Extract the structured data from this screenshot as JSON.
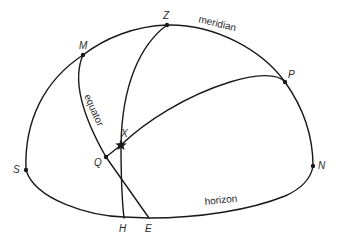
{
  "diagram": {
    "points": {
      "Z": {
        "label": "Z",
        "role": "zenith"
      },
      "M": {
        "label": "M",
        "role": "meridian–equator intersection"
      },
      "P": {
        "label": "P",
        "role": "celestial pole"
      },
      "X": {
        "label": "X",
        "role": "star"
      },
      "Q": {
        "label": "Q",
        "role": "equator point on hour circle of X"
      },
      "S": {
        "label": "S",
        "role": "south point"
      },
      "N": {
        "label": "N",
        "role": "north point"
      },
      "H": {
        "label": "H",
        "role": "foot of vertical circle on horizon"
      },
      "E": {
        "label": "E",
        "role": "east point"
      }
    },
    "curves": {
      "meridian": {
        "label": "meridian"
      },
      "equator": {
        "label": "equator"
      },
      "horizon": {
        "label": "horizon"
      },
      "vertical_circle": {
        "label": ""
      },
      "hour_circle": {
        "label": ""
      }
    },
    "colors": {
      "line": "#1a1a1a",
      "text": "#2a2a2a",
      "background": "#ffffff"
    }
  }
}
